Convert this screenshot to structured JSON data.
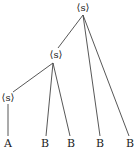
{
  "diagram": {
    "type": "tree",
    "colors": {
      "line": "#444444",
      "text": "#222222",
      "background": "#ffffff"
    },
    "nodes": {
      "root": {
        "label": "⟨s⟩"
      },
      "mid": {
        "label": "⟨s⟩"
      },
      "low": {
        "label": "⟨s⟩"
      }
    },
    "leaves": [
      {
        "label": "A"
      },
      {
        "label": "B"
      },
      {
        "label": "B"
      },
      {
        "label": "B"
      },
      {
        "label": "B"
      }
    ],
    "structure": "root → [mid, B, B]; mid → [low, B, B]; low → [A]"
  }
}
